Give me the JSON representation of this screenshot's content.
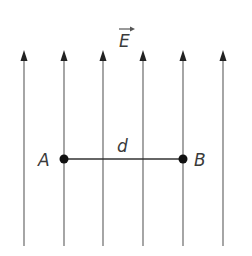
{
  "diagram": {
    "field_label": "E",
    "field_vector_arrow": true,
    "field_line_count": 6,
    "field_direction": "up",
    "point_a_label": "A",
    "point_b_label": "B",
    "distance_label": "d",
    "colors": {
      "line": "#6a6a6a",
      "point": "#111111",
      "text": "#3a3a3a"
    }
  }
}
